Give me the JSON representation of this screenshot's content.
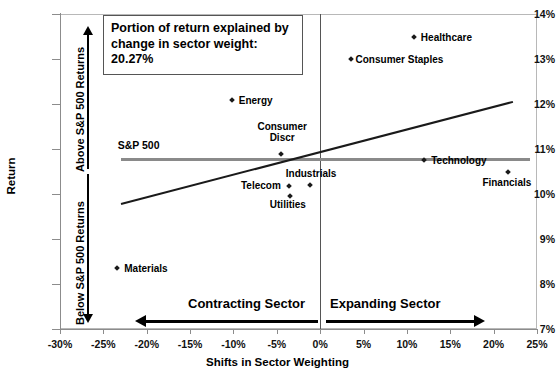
{
  "chart_data": {
    "type": "scatter",
    "title": "",
    "xlabel": "Shifts in Sector Weighting",
    "ylabel": "Return",
    "xlim": [
      -30,
      25
    ],
    "ylim": [
      7,
      14
    ],
    "xticks": [
      "-30%",
      "-25%",
      "-20%",
      "-15%",
      "-10%",
      "-5%",
      "0%",
      "5%",
      "10%",
      "15%",
      "20%",
      "25%"
    ],
    "xtick_values": [
      -30,
      -25,
      -20,
      -15,
      -10,
      -5,
      0,
      5,
      10,
      15,
      20,
      25
    ],
    "yticks": [
      "7%",
      "8%",
      "9%",
      "10%",
      "11%",
      "12%",
      "13%",
      "14%"
    ],
    "ytick_values": [
      7,
      8,
      9,
      10,
      11,
      12,
      13,
      14
    ],
    "grid": false,
    "legend_position": "none",
    "points": [
      {
        "label": "Energy",
        "x": -10.2,
        "y": 12.1,
        "label_dx": 7,
        "label_dy": -5
      },
      {
        "label": "Healthcare",
        "x": 10.8,
        "y": 13.5,
        "label_dx": 7,
        "label_dy": -5
      },
      {
        "label": "Consumer Staples",
        "x": 3.5,
        "y": 13.0,
        "label_dx": 5,
        "label_dy": -5
      },
      {
        "label": "Consumer Discr",
        "x": -4.5,
        "y": 10.88,
        "label_dx": 0,
        "label_dy": -33
      },
      {
        "label": "Technology",
        "x": 12.0,
        "y": 10.75,
        "label_dx": 7,
        "label_dy": -5
      },
      {
        "label": "Financials",
        "x": 21.7,
        "y": 10.5,
        "label_dx": 0,
        "label_dy": 5
      },
      {
        "label": "Industrials",
        "x": -1.2,
        "y": 10.2,
        "label_dx": -24,
        "label_dy": -17
      },
      {
        "label": "Telecom",
        "x": -3.6,
        "y": 10.18,
        "label_dx": -48,
        "label_dy": -6
      },
      {
        "label": "Utilities",
        "x": -3.5,
        "y": 9.96,
        "label_dx": -20,
        "label_dy": 3
      },
      {
        "label": "Materials",
        "x": -23.4,
        "y": 8.35,
        "label_dx": 7,
        "label_dy": -5
      }
    ],
    "benchmark_line": {
      "label": "S&P 500",
      "value": 10.8,
      "x_start": -23.0,
      "x_end": 24.2,
      "color": "#8a8a8a"
    },
    "trend_line": {
      "label": "",
      "x_start": -23.0,
      "y_start": 9.8,
      "x_end": 22.2,
      "y_end": 12.07,
      "color": "#1a1a1a"
    }
  },
  "annotation": {
    "line1": "Portion of return explained by",
    "line2": "change in sector weight:",
    "line3": "20.27%"
  },
  "regions": {
    "above_label": "Above S&P 500 Returns",
    "below_label": "Below S&P 500 Returns"
  },
  "sectors": {
    "contracting_label": "Contracting Sector",
    "expanding_label": "Expanding Sector"
  }
}
